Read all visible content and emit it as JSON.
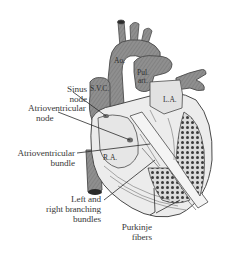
{
  "figure": {
    "colors": {
      "background": "#ffffff",
      "vessel_fill": "#8f8f8f",
      "vessel_dark": "#5c5c5c",
      "chamber_fill": "#e6e6e6",
      "outline": "#4a4a4a",
      "label_text": "#3a3a3a",
      "leader_line": "#2a2a2a",
      "muscle_spots": "#3b3b3b"
    }
  },
  "structure_labels": {
    "aorta": "Ao.",
    "pulmonary_artery_line1": "Pul.",
    "pulmonary_artery_line2": "art.",
    "superior_vena_cava": "S.V.C.",
    "left_atrium": "L.A.",
    "right_atrium": "R.A."
  },
  "callouts": [
    {
      "id": "sinus-node",
      "line1": "Sinus",
      "line2": "node"
    },
    {
      "id": "av-node",
      "line1": "Atrioventricular",
      "line2": "node"
    },
    {
      "id": "av-bundle",
      "line1": "Atrioventricular",
      "line2": "bundle"
    },
    {
      "id": "branching-bundles",
      "line1": "Left and",
      "line2": "right branching",
      "line3": "bundles"
    },
    {
      "id": "purkinje-fibers",
      "line1": "Purkinje",
      "line2": "fibers"
    }
  ]
}
